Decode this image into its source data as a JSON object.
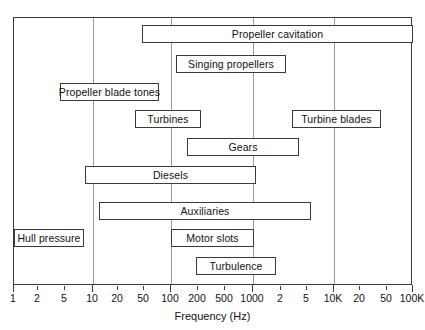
{
  "chart_data": {
    "type": "bar",
    "orientation": "horizontal",
    "title": "",
    "xlabel": "Frequency (Hz)",
    "ylabel": "",
    "xscale": "log",
    "xlim": [
      1,
      100000
    ],
    "grid": true,
    "legend": "none",
    "annotation": "Horizontal range bars showing the frequency band over which each shipboard noise source radiates.",
    "axis": {
      "label": "Frequency (Hz)",
      "ticks": [
        {
          "label": "1",
          "value": 1,
          "major": true,
          "x": 13
        },
        {
          "label": "2",
          "value": 2,
          "major": false,
          "x": 37
        },
        {
          "label": "5",
          "value": 5,
          "major": false,
          "x": 64
        },
        {
          "label": "10",
          "value": 10,
          "major": true,
          "x": 92
        },
        {
          "label": "20",
          "value": 20,
          "major": false,
          "x": 117
        },
        {
          "label": "50",
          "value": 50,
          "major": false,
          "x": 143
        },
        {
          "label": "100",
          "value": 100,
          "major": true,
          "x": 170
        },
        {
          "label": "200",
          "value": 200,
          "major": false,
          "x": 197
        },
        {
          "label": "500",
          "value": 500,
          "major": false,
          "x": 224
        },
        {
          "label": "1000",
          "value": 1000,
          "major": true,
          "x": 252
        },
        {
          "label": "2",
          "value": 2000,
          "major": false,
          "x": 280
        },
        {
          "label": "5",
          "value": 5000,
          "major": false,
          "x": 306
        },
        {
          "label": "10K",
          "value": 10000,
          "major": true,
          "x": 333
        },
        {
          "label": "20",
          "value": 20000,
          "major": false,
          "x": 359
        },
        {
          "label": "50",
          "value": 50000,
          "major": false,
          "x": 386
        },
        {
          "label": "100K",
          "value": 100000,
          "major": true,
          "x": 412
        }
      ],
      "gridline_values": [
        10,
        100,
        1000,
        10000
      ]
    },
    "categories": [
      "Propeller cavitation",
      "Singing propellers",
      "Propeller blade tones",
      "Turbines",
      "Turbine blades",
      "Gears",
      "Diesels",
      "Auxiliaries",
      "Hull pressure",
      "Motor slots",
      "Turbulence"
    ],
    "bars": [
      {
        "label": "Propeller cavitation",
        "x_start": 30,
        "x_end": 100000,
        "px_left": 141,
        "px_width": 271,
        "px_top": 24
      },
      {
        "label": "Singing propellers",
        "x_start": 110,
        "x_end": 2400,
        "px_left": 175,
        "px_width": 110,
        "px_top": 54
      },
      {
        "label": "Propeller blade tones",
        "x_start": 3.4,
        "x_end": 70,
        "px_left": 59,
        "px_width": 99,
        "px_top": 82
      },
      {
        "label": "Turbines",
        "x_start": 30,
        "x_end": 260,
        "px_left": 134,
        "px_width": 66,
        "px_top": 109
      },
      {
        "label": "Turbine blades",
        "x_start": 3000,
        "x_end": 50000,
        "px_left": 291,
        "px_width": 89,
        "px_top": 109
      },
      {
        "label": "Gears",
        "x_start": 160,
        "x_end": 2600,
        "px_left": 186,
        "px_width": 112,
        "px_top": 137
      },
      {
        "label": "Diesels",
        "x_start": 7.5,
        "x_end": 1100,
        "px_left": 84,
        "px_width": 171,
        "px_top": 165
      },
      {
        "label": "Auxiliaries",
        "x_start": 12,
        "x_end": 4000,
        "px_left": 98,
        "px_width": 212,
        "px_top": 201
      },
      {
        "label": "Hull pressure",
        "x_start": 1,
        "x_end": 7,
        "px_left": 13,
        "px_width": 70,
        "px_top": 228
      },
      {
        "label": "Motor slots",
        "x_start": 100,
        "x_end": 1000,
        "px_left": 170,
        "px_width": 83,
        "px_top": 228
      },
      {
        "label": "Turbulence",
        "x_start": 190,
        "x_end": 1800,
        "px_left": 195,
        "px_width": 80,
        "px_top": 256
      }
    ]
  }
}
